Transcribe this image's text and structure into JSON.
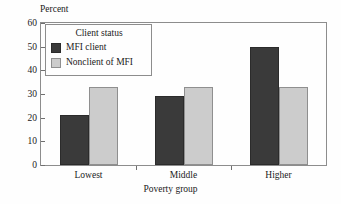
{
  "chart_data": {
    "type": "bar",
    "title": "",
    "subtitle": "",
    "categories": [
      "Lowest",
      "Middle",
      "Higher"
    ],
    "series": [
      {
        "name": "MFI client",
        "values": [
          21,
          29,
          50
        ],
        "color": "#3a3a3a"
      },
      {
        "name": "Nonclient of MFI",
        "values": [
          33,
          33,
          33
        ],
        "color": "#cccccc"
      }
    ],
    "xlabel": "Poverty group",
    "ylabel": "Percent",
    "ylim": [
      0,
      60
    ],
    "yticks": [
      0,
      10,
      20,
      30,
      40,
      50,
      60
    ],
    "ytick_labels": [
      "0",
      "10",
      "20",
      "30",
      "40",
      "50",
      "60"
    ],
    "grid": false,
    "legend": {
      "title": "Client status",
      "position": "upper-left",
      "entries": [
        "MFI client",
        "Nonclient of MFI"
      ]
    },
    "frame_color": "#8d8d8d",
    "background": "#fefefe"
  }
}
